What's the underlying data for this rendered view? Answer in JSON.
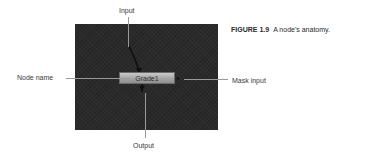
{
  "figure": {
    "number_label": "FIGURE 1.9",
    "caption_text": "A node's anatomy."
  },
  "node": {
    "name": "Grade1"
  },
  "callouts": {
    "input": "Input",
    "node_name": "Node name",
    "mask_input": "Mask input",
    "output": "Output"
  },
  "colors": {
    "panel_bg": "#2a2a2a",
    "node_fill": "#a8a8a8",
    "leader_line": "#9a9a9a",
    "text": "#3a3a3a"
  }
}
